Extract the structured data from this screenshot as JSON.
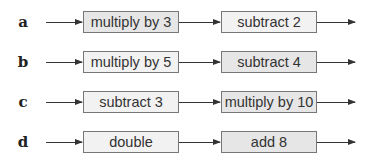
{
  "colors": {
    "box_dark": "#e6e6e6",
    "box_light": "#f2f2f2",
    "stroke": "#333333"
  },
  "rows": [
    {
      "label": "a",
      "step1": "multiply by 3",
      "step2": "subtract 2"
    },
    {
      "label": "b",
      "step1": "multiply by 5",
      "step2": "subtract 4"
    },
    {
      "label": "c",
      "step1": "subtract 3",
      "step2": "multiply by 10"
    },
    {
      "label": "d",
      "step1": "double",
      "step2": "add 8"
    }
  ]
}
